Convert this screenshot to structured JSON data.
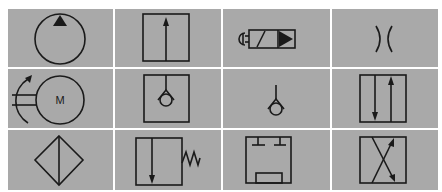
{
  "symbols": [
    {
      "row": 1,
      "col": 1,
      "name": "pump-hydraulic-fixed"
    },
    {
      "row": 1,
      "col": 2,
      "name": "valve-envelope-single-flow"
    },
    {
      "row": 1,
      "col": 3,
      "name": "pushbutton-solenoid-valve"
    },
    {
      "row": 1,
      "col": 4,
      "name": "restrictor-orifice"
    },
    {
      "row": 2,
      "col": 1,
      "name": "electric-motor-rotating",
      "label": "M"
    },
    {
      "row": 2,
      "col": 2,
      "name": "check-valve-envelope"
    },
    {
      "row": 2,
      "col": 3,
      "name": "check-valve"
    },
    {
      "row": 2,
      "col": 4,
      "name": "valve-envelope-two-flow"
    },
    {
      "row": 3,
      "col": 1,
      "name": "filter"
    },
    {
      "row": 3,
      "col": 2,
      "name": "valve-envelope-spring-return"
    },
    {
      "row": 3,
      "col": 3,
      "name": "valve-envelope-blocked-ports"
    },
    {
      "row": 3,
      "col": 4,
      "name": "valve-envelope-crossed-flow"
    }
  ],
  "colors": {
    "cell_background": "#a9a9a9",
    "grid_lines": "#ffffff",
    "stroke": "#1a1a1a"
  }
}
